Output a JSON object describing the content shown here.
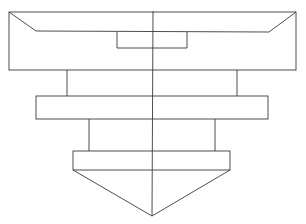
{
  "diagram": {
    "type": "technical-line-drawing",
    "stroke_color": "#3a3a3a",
    "background": "#ffffff",
    "shapes": {
      "top_block": {
        "x1": 9,
        "y1": 12,
        "x2": 296,
        "y2": 70
      },
      "top_inner_line": {
        "left": [
          36,
          31
        ],
        "right": [
          269,
          32
        ]
      },
      "top_notch": {
        "x1": 117,
        "y1": 32,
        "x2": 187,
        "y2": 48
      },
      "upper_stem": {
        "left_x": 67,
        "right_x": 237,
        "y1": 70,
        "y2": 96
      },
      "middle_block": {
        "x1": 36,
        "y1": 96,
        "x2": 268,
        "y2": 119
      },
      "lower_stem": {
        "left_x": 89,
        "right_x": 215,
        "y1": 119,
        "y2": 151
      },
      "bottom_block": {
        "x1": 73,
        "y1": 151,
        "x2": 230,
        "y2": 170
      },
      "cone_tip": {
        "apex": [
          152,
          216
        ]
      },
      "centerline": {
        "x": 153,
        "y1": 11,
        "y2": 216
      }
    }
  }
}
